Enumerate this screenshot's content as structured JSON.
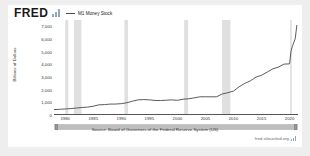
{
  "header": {
    "logo_text": "FRED",
    "logo_icon": "bar-chart-icon",
    "legend_label": "M1 Money Stock"
  },
  "footer": {
    "source": "Source: Board of Governors of the Federal Reserve System (US)",
    "watermark": "fred.stlouisfed.org",
    "watermark_icon": "fred-mark-icon"
  },
  "slider": {
    "left_handle": "range-start-handle",
    "right_handle": "range-end-handle"
  },
  "chart_data": {
    "type": "line",
    "title": "M1 Money Stock",
    "xlabel": "",
    "ylabel": "Billions of Dollars",
    "ylim": [
      0,
      7500
    ],
    "xlim": [
      1978,
      2021.5
    ],
    "grid": false,
    "legend_position": "top-left",
    "line_color": "#4a4a4a",
    "recession_band_color": "#e0e0e0",
    "ytick_labels": [
      "7,000",
      "6,000",
      "5,000",
      "4,000",
      "3,000",
      "2,000",
      "1,000",
      "0"
    ],
    "ytick_values": [
      7000,
      6000,
      5000,
      4000,
      3000,
      2000,
      1000,
      0
    ],
    "xtick_labels": [
      "1980",
      "1985",
      "1990",
      "1995",
      "2000",
      "2005",
      "2010",
      "2015",
      "2020"
    ],
    "xtick_values": [
      1980,
      1985,
      1990,
      1995,
      2000,
      2005,
      2010,
      2015,
      2020
    ],
    "series": [
      {
        "name": "M1 Money Stock",
        "x": [
          1978.0,
          1979.0,
          1980.0,
          1981.0,
          1982.0,
          1983.0,
          1984.0,
          1985.0,
          1986.0,
          1987.0,
          1988.0,
          1989.0,
          1990.0,
          1991.0,
          1992.0,
          1993.0,
          1994.0,
          1995.0,
          1996.0,
          1997.0,
          1998.0,
          1999.0,
          2000.0,
          2001.0,
          2002.0,
          2003.0,
          2004.0,
          2005.0,
          2006.0,
          2007.0,
          2008.0,
          2009.0,
          2010.0,
          2011.0,
          2012.0,
          2013.0,
          2014.0,
          2015.0,
          2016.0,
          2017.0,
          2018.0,
          2019.0,
          2020.0,
          2020.25,
          2020.5,
          2021.0,
          2021.3
        ],
        "y": [
          350,
          375,
          400,
          430,
          475,
          520,
          550,
          620,
          730,
          750,
          790,
          795,
          825,
          900,
          1025,
          1130,
          1150,
          1130,
          1080,
          1075,
          1100,
          1125,
          1090,
          1180,
          1215,
          1290,
          1370,
          1375,
          1370,
          1375,
          1600,
          1700,
          1830,
          2170,
          2440,
          2640,
          2940,
          3090,
          3340,
          3600,
          3740,
          3980,
          4000,
          5000,
          5400,
          6000,
          7100
        ]
      }
    ],
    "recession_bands": [
      {
        "start": 1980.0,
        "end": 1980.55
      },
      {
        "start": 1981.55,
        "end": 1982.9
      },
      {
        "start": 1990.55,
        "end": 1991.2
      },
      {
        "start": 2001.2,
        "end": 2001.9
      },
      {
        "start": 2007.95,
        "end": 2009.45
      },
      {
        "start": 2020.1,
        "end": 2020.4
      }
    ]
  }
}
